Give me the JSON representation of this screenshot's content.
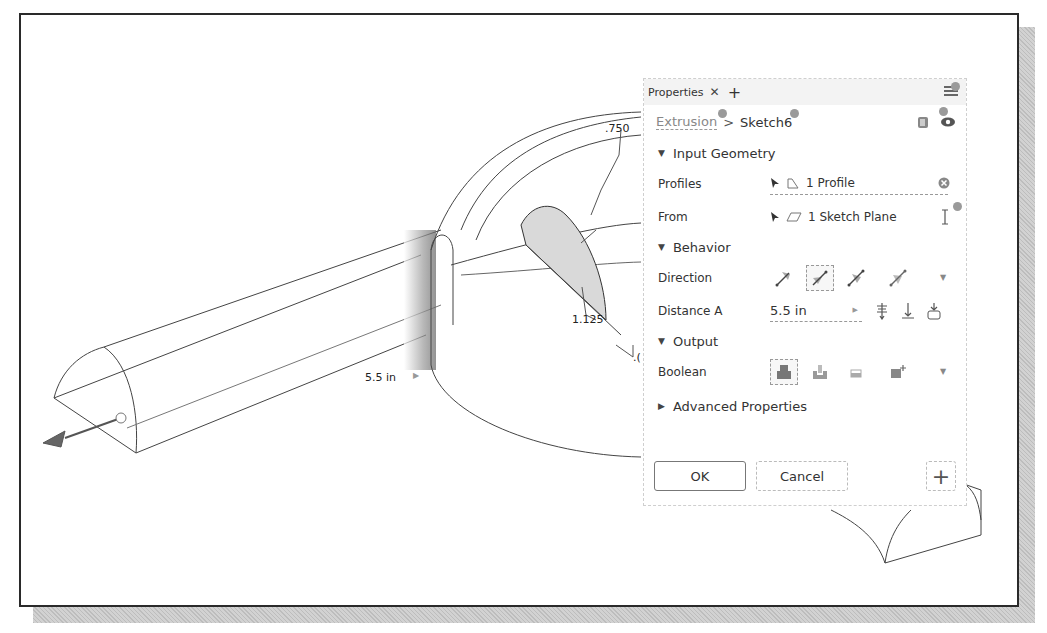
{
  "viewport": {
    "dimensions": [
      {
        "id": "distance",
        "text": "5.5 in"
      },
      {
        "id": "radius",
        "text": ".750"
      },
      {
        "id": "offset",
        "text": "1.125"
      },
      {
        "id": "partial",
        "text": ".("
      }
    ]
  },
  "panel": {
    "tab_label": "Properties",
    "tab_close": "✕",
    "tab_add": "+",
    "breadcrumb": {
      "parent": "Extrusion",
      "separator": ">",
      "current": "Sketch6"
    },
    "sections": {
      "input_geometry": {
        "title": "Input Geometry",
        "profiles": {
          "label": "Profiles",
          "value": "1 Profile"
        },
        "from": {
          "label": "From",
          "value": "1 Sketch Plane"
        }
      },
      "behavior": {
        "title": "Behavior",
        "direction": {
          "label": "Direction",
          "options": [
            "default-direction",
            "flipped-direction",
            "symmetric-direction",
            "asymmetric-direction"
          ],
          "selected": 1
        },
        "distance_a": {
          "label": "Distance A",
          "value": "5.5 in"
        }
      },
      "output": {
        "title": "Output",
        "boolean": {
          "label": "Boolean",
          "options": [
            "join",
            "cut",
            "intersect",
            "new-solid"
          ],
          "selected": 0
        }
      },
      "advanced": {
        "title": "Advanced Properties"
      }
    },
    "buttons": {
      "ok": "OK",
      "cancel": "Cancel",
      "add": "+"
    }
  },
  "colors": {
    "frame_border": "#2a2a2a",
    "profile_fill": "#d9d9d9",
    "panel_border": "#cfcfcf",
    "indicator_dot": "#9a9a9a"
  }
}
